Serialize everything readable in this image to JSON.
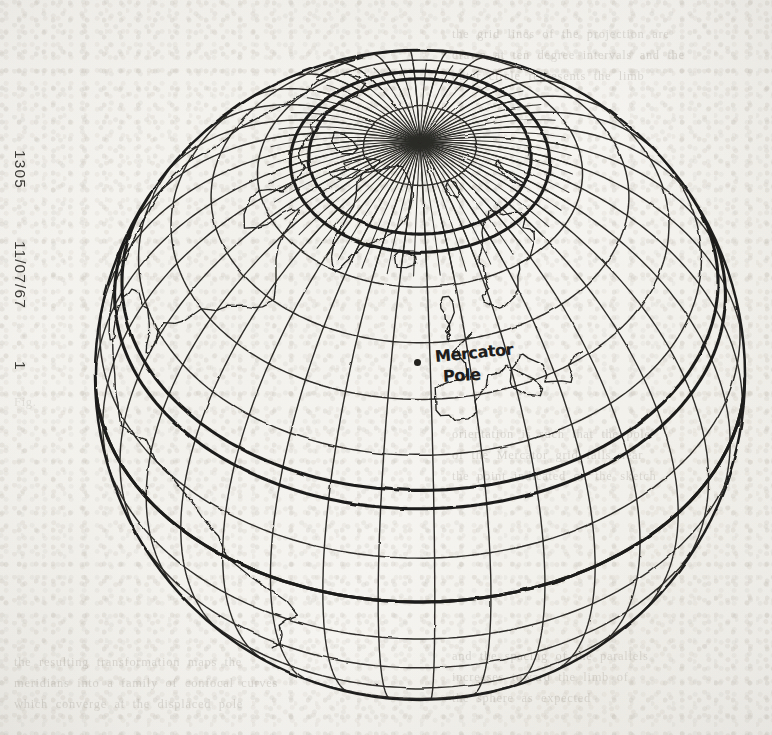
{
  "document": {
    "type": "scanned-page",
    "paper_color": "#f5f3ef",
    "ink_color": "#2a2926"
  },
  "margin_identifier": {
    "name": "microfilm-frame-id",
    "orientation": "rotated-90-clockwise",
    "fields": [
      {
        "key": "frame_number",
        "value": "1305"
      },
      {
        "key": "date",
        "value": "11/07/67"
      },
      {
        "key": "page_number",
        "value": "1"
      }
    ]
  },
  "figure": {
    "kind": "orthographic-globe-projection",
    "center_px": {
      "x": 420,
      "y": 375
    },
    "radius_px": 325,
    "pole_px": {
      "x": 418,
      "y": 148
    },
    "meridian_count": 36,
    "parallel_count": 17,
    "emphasised_parallels": [
      "arctic-circle",
      "tropic-of-cancer",
      "equator"
    ],
    "continents": [
      "greenland",
      "north-america",
      "central-america",
      "scandinavia",
      "europe",
      "arctic-islands",
      "iceland"
    ]
  },
  "annotation": {
    "name": "mercator-pole-label",
    "line1": "Mercator",
    "line2": "Pole",
    "marker": "filled-dot",
    "marker_px": {
      "x": 417,
      "y": 362
    },
    "style": "handwritten"
  },
  "show_through_text": {
    "note": "faint text bleeding through from the reverse side of the sheet",
    "top_right": "the  grid  lines  of  the  projection  are\ndrawn  at  ten  degree  intervals  and  the\nouter  circle  represents  the  limb",
    "mid_right": "orientation  is  such  that  the  pole\nof  the  Mercator  grid  falls  near\nthe  point  indicated  on  the  sketch",
    "mid_left": "Fig.",
    "bottom": "the  resulting  transformation  maps  the\nmeridians  into  a  family  of  confocal  curves\nwhich  converge  at  the  displaced  pole",
    "bottom_right": "and  the  spacing  of  the  parallels\nincreases  toward  the  limb  of\nthe  sphere  as  expected"
  }
}
